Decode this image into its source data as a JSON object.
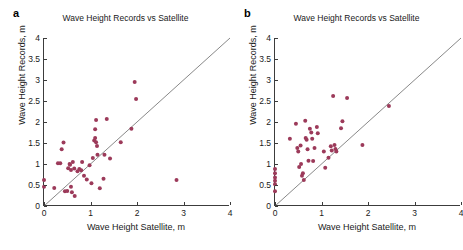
{
  "figure": {
    "axis_color": "#3c3c3c",
    "marker_color": "#9c3a5a",
    "line_color": "#555555",
    "background": "#ffffff"
  },
  "panels": [
    {
      "label": "a",
      "title": "Wave Height Records vs Satellite",
      "xlabel": "Wave Height Satellite, m",
      "ylabel": "Wave Height Records, m"
    },
    {
      "label": "b",
      "title": "Wave Height Records vs Satellite",
      "xlabel": "Wave Height Satellite, m",
      "ylabel": "Wave Height Records, m"
    }
  ],
  "chart_data": [
    {
      "type": "scatter",
      "panel": "a",
      "title": "Wave Height Records vs Satellite",
      "xlabel": "Wave Height Satellite, m",
      "ylabel": "Wave Height Records, m",
      "xlim": [
        0,
        4
      ],
      "ylim": [
        0,
        4
      ],
      "xticks": [
        0,
        1,
        2,
        3,
        4
      ],
      "yticks": [
        0,
        0.5,
        1,
        1.5,
        2,
        2.5,
        3,
        3.5,
        4
      ],
      "grid": false,
      "legend": null,
      "reference_line": {
        "name": "one-to-one",
        "from": [
          0,
          0
        ],
        "to": [
          4,
          4
        ]
      },
      "series": [
        {
          "name": "Wave height pairs",
          "color": "#9c3a5a",
          "points": [
            [
              0.0,
              0.62
            ],
            [
              0.0,
              0.46
            ],
            [
              0.22,
              0.43
            ],
            [
              0.3,
              1.02
            ],
            [
              0.35,
              1.02
            ],
            [
              0.38,
              1.35
            ],
            [
              0.42,
              1.51
            ],
            [
              0.45,
              0.35
            ],
            [
              0.5,
              0.36
            ],
            [
              0.52,
              0.9
            ],
            [
              0.55,
              1.0
            ],
            [
              0.56,
              0.98
            ],
            [
              0.58,
              0.86
            ],
            [
              0.58,
              0.46
            ],
            [
              0.6,
              0.33
            ],
            [
              0.62,
              1.05
            ],
            [
              0.65,
              0.89
            ],
            [
              0.66,
              0.24
            ],
            [
              0.72,
              0.83
            ],
            [
              0.76,
              0.88
            ],
            [
              0.8,
              0.85
            ],
            [
              0.82,
              1.05
            ],
            [
              0.86,
              0.72
            ],
            [
              0.92,
              0.63
            ],
            [
              0.98,
              0.97
            ],
            [
              1.02,
              0.54
            ],
            [
              1.05,
              1.14
            ],
            [
              1.08,
              1.56
            ],
            [
              1.1,
              1.62
            ],
            [
              1.1,
              1.83
            ],
            [
              1.12,
              2.05
            ],
            [
              1.12,
              1.52
            ],
            [
              1.14,
              1.43
            ],
            [
              1.15,
              1.22
            ],
            [
              1.2,
              0.42
            ],
            [
              1.28,
              0.65
            ],
            [
              1.3,
              1.22
            ],
            [
              1.35,
              2.07
            ],
            [
              1.42,
              1.13
            ],
            [
              1.65,
              1.52
            ],
            [
              1.88,
              1.84
            ],
            [
              1.95,
              2.95
            ],
            [
              1.98,
              2.55
            ],
            [
              2.85,
              0.62
            ]
          ]
        }
      ]
    },
    {
      "type": "scatter",
      "panel": "b",
      "title": "Wave Height Records vs Satellite",
      "xlabel": "Wave Height Satellite, m",
      "ylabel": "Wave Height Records, m",
      "xlim": [
        0,
        4
      ],
      "ylim": [
        0,
        4
      ],
      "xticks": [
        0,
        1,
        2,
        3,
        4
      ],
      "yticks": [
        0,
        0.5,
        1,
        1.5,
        2,
        2.5,
        3,
        3.5,
        4
      ],
      "grid": false,
      "legend": null,
      "reference_line": {
        "name": "one-to-one",
        "from": [
          0,
          0
        ],
        "to": [
          4,
          4
        ]
      },
      "series": [
        {
          "name": "Wave height pairs",
          "color": "#9c3a5a",
          "points": [
            [
              0.0,
              0.88
            ],
            [
              0.0,
              0.78
            ],
            [
              0.0,
              0.68
            ],
            [
              0.0,
              0.6
            ],
            [
              0.0,
              0.52
            ],
            [
              0.0,
              0.35
            ],
            [
              0.32,
              1.6
            ],
            [
              0.45,
              1.96
            ],
            [
              0.48,
              1.38
            ],
            [
              0.5,
              1.3
            ],
            [
              0.52,
              0.93
            ],
            [
              0.55,
              1.44
            ],
            [
              0.56,
              1.0
            ],
            [
              0.58,
              0.72
            ],
            [
              0.6,
              0.78
            ],
            [
              0.62,
              0.62
            ],
            [
              0.65,
              2.03
            ],
            [
              0.66,
              1.62
            ],
            [
              0.68,
              1.58
            ],
            [
              0.7,
              1.35
            ],
            [
              0.72,
              1.08
            ],
            [
              0.75,
              1.84
            ],
            [
              0.78,
              1.75
            ],
            [
              0.8,
              1.6
            ],
            [
              0.82,
              1.07
            ],
            [
              0.85,
              1.38
            ],
            [
              0.9,
              1.88
            ],
            [
              0.92,
              1.73
            ],
            [
              1.05,
              1.3
            ],
            [
              1.08,
              0.91
            ],
            [
              1.15,
              1.15
            ],
            [
              1.2,
              1.42
            ],
            [
              1.22,
              1.32
            ],
            [
              1.25,
              2.62
            ],
            [
              1.28,
              1.45
            ],
            [
              1.3,
              1.36
            ],
            [
              1.32,
              1.3
            ],
            [
              1.42,
              1.85
            ],
            [
              1.45,
              2.02
            ],
            [
              1.55,
              2.57
            ],
            [
              1.88,
              1.45
            ],
            [
              2.45,
              2.38
            ]
          ]
        }
      ]
    }
  ]
}
